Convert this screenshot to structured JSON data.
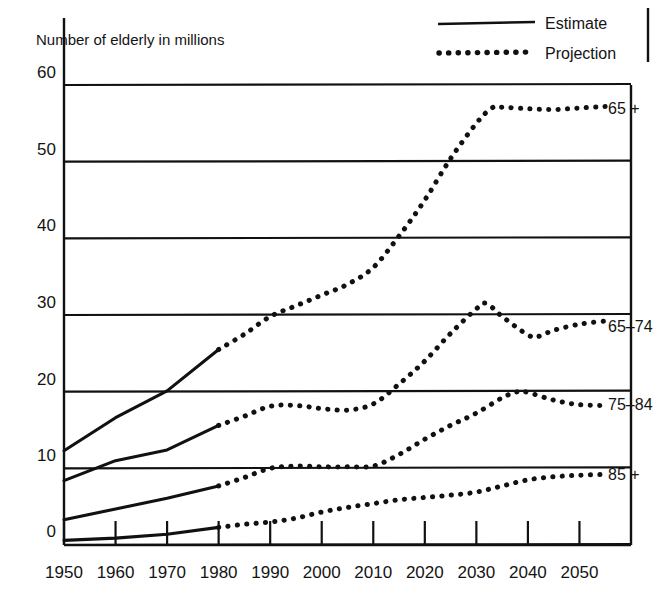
{
  "chart_data": {
    "type": "line",
    "title": "",
    "ylabel": "Number of elderly in millions",
    "xlabel": "",
    "xlim": [
      1950,
      2060
    ],
    "ylim": [
      0,
      60
    ],
    "yticks": [
      0,
      10,
      20,
      30,
      40,
      50,
      60
    ],
    "xticks": [
      1950,
      1960,
      1970,
      1980,
      1990,
      2000,
      2010,
      2020,
      2030,
      2040,
      2050
    ],
    "grid": "horizontal",
    "legend_position": "top-right",
    "legend": [
      {
        "key": "estimate",
        "label": "Estimate",
        "style": "solid"
      },
      {
        "key": "projection",
        "label": "Projection",
        "style": "dotted"
      }
    ],
    "series": [
      {
        "name": "65 +",
        "label": "65 +",
        "label_x": 2054,
        "label_y": 57.0,
        "estimate": {
          "x": [
            1950,
            1960,
            1970,
            1980
          ],
          "values": [
            12.3,
            16.6,
            20.1,
            25.5
          ]
        },
        "projection": {
          "x": [
            1980,
            1985,
            1990,
            1995,
            2000,
            2005,
            2010,
            2015,
            2020,
            2025,
            2030,
            2033,
            2035,
            2040,
            2045,
            2050,
            2055
          ],
          "values": [
            25.5,
            27.5,
            29.8,
            31.2,
            32.6,
            34.0,
            36.2,
            40.3,
            45.0,
            50.4,
            55.0,
            57.0,
            57.1,
            56.9,
            56.8,
            57.0,
            57.2
          ]
        }
      },
      {
        "name": "65-74",
        "label": "65–74",
        "label_x": 2054,
        "label_y": 28.6,
        "estimate": {
          "x": [
            1950,
            1960,
            1970,
            1980
          ],
          "values": [
            8.4,
            11.0,
            12.4,
            15.6
          ]
        },
        "projection": {
          "x": [
            1980,
            1985,
            1990,
            1995,
            2000,
            2005,
            2010,
            2015,
            2020,
            2025,
            2030,
            2032,
            2035,
            2040,
            2042,
            2045,
            2050,
            2055
          ],
          "values": [
            15.6,
            16.8,
            18.1,
            18.2,
            17.8,
            17.6,
            18.4,
            21.0,
            24.0,
            27.6,
            30.8,
            31.5,
            29.8,
            27.4,
            27.2,
            28.0,
            28.8,
            29.2
          ]
        }
      },
      {
        "name": "75-84",
        "label": "75–84",
        "label_x": 2054,
        "label_y": 18.4,
        "estimate": {
          "x": [
            1950,
            1960,
            1970,
            1980
          ],
          "values": [
            3.3,
            4.7,
            6.1,
            7.7
          ]
        },
        "projection": {
          "x": [
            1980,
            1985,
            1990,
            1995,
            2000,
            2005,
            2010,
            2015,
            2020,
            2025,
            2030,
            2035,
            2038,
            2040,
            2045,
            2050,
            2055
          ],
          "values": [
            7.7,
            8.8,
            10.0,
            10.3,
            10.2,
            10.2,
            10.3,
            11.8,
            13.8,
            15.6,
            17.2,
            19.2,
            20.0,
            19.9,
            18.9,
            18.3,
            18.2
          ]
        }
      },
      {
        "name": "85 +",
        "label": "85 +",
        "label_x": 2054,
        "label_y": 9.2,
        "estimate": {
          "x": [
            1950,
            1960,
            1970,
            1980
          ],
          "values": [
            0.6,
            0.9,
            1.4,
            2.3
          ]
        },
        "projection": {
          "x": [
            1980,
            1985,
            1990,
            1995,
            2000,
            2005,
            2010,
            2015,
            2020,
            2025,
            2030,
            2035,
            2040,
            2045,
            2050,
            2055
          ],
          "values": [
            2.3,
            2.7,
            3.0,
            3.5,
            4.3,
            4.9,
            5.4,
            5.9,
            6.2,
            6.5,
            6.9,
            7.7,
            8.5,
            8.9,
            9.1,
            9.2
          ]
        }
      }
    ]
  },
  "ylabel": "Number of elderly in millions",
  "yticks": [
    "60",
    "50",
    "40",
    "30",
    "20",
    "10",
    "0"
  ],
  "xticks": [
    "1950",
    "1960",
    "1970",
    "1980",
    "1990",
    "2000",
    "2010",
    "2020",
    "2030",
    "2040",
    "2050"
  ],
  "legend": {
    "estimate_label": "Estimate",
    "projection_label": "Projection"
  },
  "series_labels": {
    "s0": "65 +",
    "s1": "65–74",
    "s2": "75–84",
    "s3": "85 +"
  }
}
